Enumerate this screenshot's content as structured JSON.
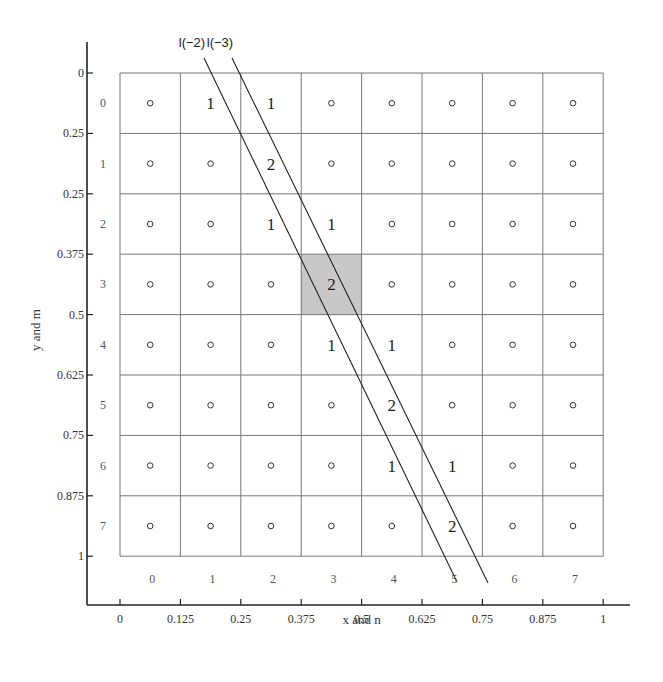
{
  "figure": {
    "x_axis_title": "x and n",
    "y_axis_title": "y and m",
    "x_ticks": [
      "0",
      "0.125",
      "0.25",
      "0.375",
      "0.5",
      "0.625",
      "0.75",
      "0.875",
      "1"
    ],
    "y_ticks": [
      "0",
      "0.25",
      "0.25",
      "0.375",
      "0.5",
      "0.625",
      "0.75",
      "0.875",
      "1"
    ],
    "column_indices": [
      "0",
      "1",
      "2",
      "3",
      "4",
      "5",
      "6",
      "7"
    ],
    "row_indices": [
      "0",
      "1",
      "2",
      "3",
      "4",
      "5",
      "6",
      "7"
    ],
    "lines": [
      {
        "label": "l(−2)",
        "x1": 204,
        "y1": 58,
        "x2": 457,
        "y2": 582
      },
      {
        "label": "l(−3)",
        "x1": 232,
        "y1": 58,
        "x2": 488,
        "y2": 583
      }
    ],
    "highlighted_cell": {
      "row": 3,
      "col": 3,
      "color": "#c8c8c8"
    },
    "grid_cells": [
      [
        "o",
        "1",
        "1",
        "o",
        "o",
        "o",
        "o",
        "o"
      ],
      [
        "o",
        "o",
        "2",
        "o",
        "o",
        "o",
        "o",
        "o"
      ],
      [
        "o",
        "o",
        "1",
        "1",
        "o",
        "o",
        "o",
        "o"
      ],
      [
        "o",
        "o",
        "o",
        "2",
        "o",
        "o",
        "o",
        "o"
      ],
      [
        "o",
        "o",
        "o",
        "1",
        "1",
        "o",
        "o",
        "o"
      ],
      [
        "o",
        "o",
        "o",
        "o",
        "2",
        "o",
        "o",
        "o"
      ],
      [
        "o",
        "o",
        "o",
        "o",
        "1",
        "1",
        "o",
        "o"
      ],
      [
        "o",
        "o",
        "o",
        "o",
        "o",
        "2",
        "o",
        "o"
      ]
    ]
  }
}
